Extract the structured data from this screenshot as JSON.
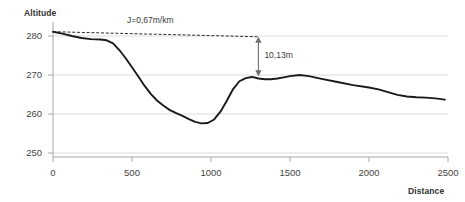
{
  "chart_data": {
    "type": "line",
    "title": "",
    "xlabel": "Distance",
    "ylabel": "Altitude",
    "xlim": [
      0,
      2600
    ],
    "ylim": [
      248,
      283
    ],
    "grid": true,
    "legend": "none",
    "x_ticks": [
      "0",
      "500",
      "1000",
      "1500",
      "2000",
      "2500"
    ],
    "x_tick_values": [
      0,
      500,
      1000,
      1500,
      2000,
      2500
    ],
    "y_ticks": [
      "250",
      "260",
      "270",
      "280"
    ],
    "y_tick_values": [
      250,
      260,
      270,
      280
    ],
    "series": [
      {
        "name": "Altitude profile",
        "color": "#1a1a1a",
        "x": [
          0,
          60,
          120,
          180,
          240,
          300,
          340,
          380,
          420,
          460,
          500,
          540,
          580,
          620,
          660,
          700,
          740,
          780,
          820,
          860,
          900,
          940,
          980,
          1020,
          1060,
          1100,
          1140,
          1180,
          1220,
          1260,
          1300,
          1340,
          1380,
          1420,
          1460,
          1500,
          1560,
          1620,
          1700,
          1800,
          1900,
          2000,
          2060,
          2120,
          2180,
          2240,
          2300,
          2360,
          2420,
          2480
        ],
        "y": [
          281.1,
          280.6,
          280.0,
          279.5,
          279.2,
          279.1,
          278.9,
          278.1,
          276.4,
          274.3,
          272.0,
          269.6,
          267.2,
          265.1,
          263.4,
          262.1,
          261.0,
          260.2,
          259.5,
          258.7,
          258.0,
          257.6,
          257.7,
          258.6,
          260.6,
          263.4,
          266.4,
          268.4,
          269.2,
          269.5,
          269.1,
          268.9,
          268.9,
          269.1,
          269.4,
          269.7,
          270.0,
          269.7,
          269.0,
          268.2,
          267.4,
          266.8,
          266.3,
          265.6,
          264.9,
          264.5,
          264.3,
          264.2,
          264.0,
          263.7
        ]
      }
    ],
    "reference_line": {
      "name": "slope-reference-line",
      "style": "dashed",
      "color": "#2b2b2b",
      "x_start": 0,
      "y_start": 281.1,
      "x_end": 1300,
      "y_end": 279.8,
      "label": "J=0,67m/km"
    },
    "annotations": [
      {
        "name": "drop-measure",
        "label": "10,13m",
        "type": "double-arrow-vertical",
        "x": 1300,
        "y_top": 279.8,
        "y_bottom": 269.7,
        "value": 10.13,
        "unit": "m"
      }
    ]
  },
  "labels": {
    "y_axis_title": "Altitude",
    "x_axis_title": "Distance",
    "slope_label": "J=0,67m/km",
    "drop_label": "10,13m"
  },
  "ticks": {
    "y": [
      "280",
      "270",
      "260",
      "250"
    ],
    "x": [
      "0",
      "500",
      "1000",
      "1500",
      "2000",
      "2500"
    ]
  },
  "colors": {
    "curve": "#1a1a1a",
    "grid": "#d9d9d9",
    "axis": "#b3b3b3",
    "text": "#3a3a3a",
    "background": "#ffffff"
  }
}
